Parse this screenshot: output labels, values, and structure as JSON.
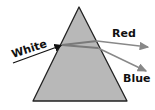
{
  "diagram": {
    "labels": {
      "incoming": "White",
      "top_exit": "Red",
      "bottom_exit": "Blue"
    },
    "colors": {
      "prism_fill": "#b8b8b8",
      "prism_stroke": "#222222",
      "incoming_ray": "#111111",
      "inner_ray": "#777777",
      "exit_ray": "#888888",
      "text": "#111111"
    }
  }
}
